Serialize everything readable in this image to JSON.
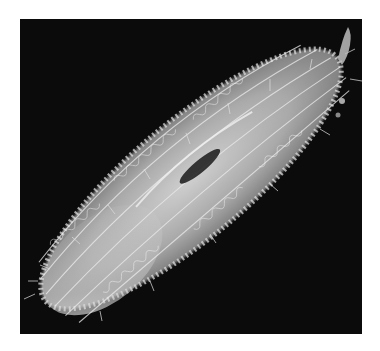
{
  "image": {
    "description": "Scanning electron micrograph of an elongated ciliated protozoan covered in cilia, oriented diagonally from lower-left to upper-right, with a dark oral groove near the center, on a black background within a white border",
    "colors": {
      "page_background": "#ffffff",
      "micrograph_background": "#0b0b0b",
      "cell_body": "#d8d8d8",
      "cilia_highlight": "#f2f2f2",
      "oral_groove": "#1a1a1a"
    }
  }
}
